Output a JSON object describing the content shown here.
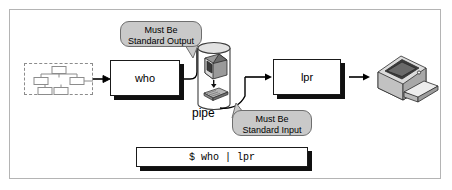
{
  "figure": {
    "border_color": "#b4b4b4",
    "background": "#ffffff"
  },
  "source": {
    "name": "process-tree-source",
    "style": "dashed",
    "border_color": "#8c8c8c"
  },
  "processes": [
    {
      "id": "who",
      "label": "who"
    },
    {
      "id": "lpr",
      "label": "lpr"
    }
  ],
  "pipe": {
    "label": "pipe",
    "contents": [
      "monitor-icon",
      "keyboard-icon"
    ],
    "fill": "#ffffff",
    "stroke": "#3c3c3c"
  },
  "callouts": [
    {
      "id": "standard-output",
      "line1": "Must Be",
      "line2": "Standard Output",
      "fill": "#c9c9c9",
      "border": "#6e6e6e"
    },
    {
      "id": "standard-input",
      "line1": "Must Be",
      "line2": "Standard Input",
      "fill": "#c9c9c9",
      "border": "#6e6e6e"
    }
  ],
  "terminal": {
    "command": "$ who | lpr"
  },
  "printer": {
    "name": "printer-icon"
  },
  "colors": {
    "ink": "#000000",
    "shadow": "#101010",
    "gray_fill": "#c9c9c9",
    "gray_stroke": "#6e6e6e",
    "light_gray": "#b4b4b4"
  }
}
